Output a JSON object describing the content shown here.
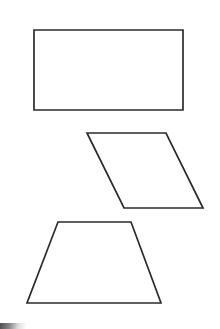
{
  "canvas": {
    "width": 220,
    "height": 329,
    "background_color": "#ffffff",
    "stroke_color": "#2b2b2d",
    "stroke_width": 1.7
  },
  "shapes": [
    {
      "name": "rectangle",
      "label": "Rectangle",
      "vertex_count": 4,
      "points": "34,30 183,30 183,110 34,110",
      "vertices": [
        {
          "label": "top-left",
          "x": 34,
          "y": 30
        },
        {
          "label": "top-right",
          "x": 183,
          "y": 30
        },
        {
          "label": "bottom-right",
          "x": 183,
          "y": 110
        },
        {
          "label": "bottom-left",
          "x": 34,
          "y": 110
        }
      ]
    },
    {
      "name": "parallelogram",
      "label": "Parallelogram",
      "vertex_count": 4,
      "points": "87,133 166,133 203,208 124,208",
      "vertices": [
        {
          "label": "top-left",
          "x": 87,
          "y": 133
        },
        {
          "label": "top-right",
          "x": 166,
          "y": 133
        },
        {
          "label": "bottom-right",
          "x": 203,
          "y": 208
        },
        {
          "label": "bottom-left",
          "x": 124,
          "y": 208
        }
      ]
    },
    {
      "name": "trapezoid",
      "label": "Trapezoid",
      "vertex_count": 4,
      "points": "58,222 131,222 161,303 27,303",
      "vertices": [
        {
          "label": "top-left",
          "x": 58,
          "y": 222
        },
        {
          "label": "top-right",
          "x": 131,
          "y": 222
        },
        {
          "label": "bottom-right",
          "x": 161,
          "y": 303
        },
        {
          "label": "bottom-left",
          "x": 27,
          "y": 303
        }
      ]
    }
  ],
  "artifacts": [
    {
      "name": "scan-smudge",
      "label": "Dark scan edge artifact at bottom-left corner",
      "x": 0,
      "y": 323,
      "width": 26,
      "height": 6
    }
  ]
}
